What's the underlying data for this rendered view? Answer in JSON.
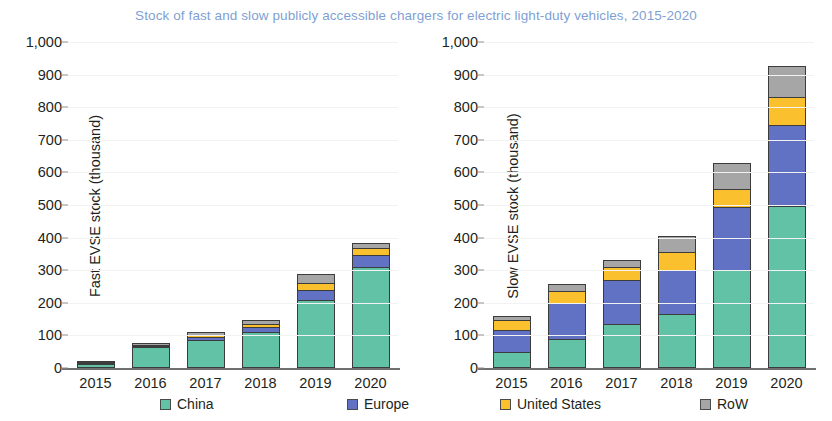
{
  "title": "Stock of fast and slow publicly accessible chargers for electric light-duty vehicles, 2015-2020",
  "title_color": "#7f9fd4",
  "legend": {
    "items": [
      {
        "label": "China",
        "color": "#62c2a5"
      },
      {
        "label": "Europe",
        "color": "#6171c4"
      },
      {
        "label": "United States",
        "color": "#fbc02d"
      },
      {
        "label": "RoW",
        "color": "#a6a6a6"
      }
    ]
  },
  "chart_data": [
    {
      "type": "bar",
      "stacked": true,
      "panel": "left",
      "title": "",
      "xlabel": "",
      "ylabel": "Fast EVSE stock (thousand)",
      "categories": [
        "2015",
        "2016",
        "2017",
        "2018",
        "2019",
        "2020"
      ],
      "ylim": [
        0,
        1000
      ],
      "yticks": [
        "0",
        "100",
        "200",
        "300",
        "400",
        "500",
        "600",
        "700",
        "800",
        "900",
        "1,000"
      ],
      "ytick_values": [
        0,
        100,
        200,
        300,
        400,
        500,
        600,
        700,
        800,
        900,
        1000
      ],
      "grid": false,
      "legend_position": "bottom",
      "series": [
        {
          "name": "China",
          "color": "#62c2a5",
          "values": [
            12,
            63,
            85,
            110,
            210,
            310
          ]
        },
        {
          "name": "Europe",
          "color": "#6171c4",
          "values": [
            4,
            5,
            10,
            16,
            30,
            38
          ]
        },
        {
          "name": "United States",
          "color": "#fbc02d",
          "values": [
            2,
            3,
            5,
            8,
            22,
            20
          ]
        },
        {
          "name": "RoW",
          "color": "#a6a6a6",
          "values": [
            4,
            6,
            10,
            13,
            25,
            15
          ]
        }
      ],
      "totals": [
        22,
        77,
        110,
        147,
        267,
        383
      ]
    },
    {
      "type": "bar",
      "stacked": true,
      "panel": "right",
      "title": "",
      "xlabel": "",
      "ylabel": "Slow EVSE stock (thousand)",
      "categories": [
        "2015",
        "2016",
        "2017",
        "2018",
        "2019",
        "2020"
      ],
      "ylim": [
        0,
        1000
      ],
      "yticks": [
        "0",
        "100",
        "200",
        "300",
        "400",
        "500",
        "600",
        "700",
        "800",
        "900",
        "1,000"
      ],
      "ytick_values": [
        0,
        100,
        200,
        300,
        400,
        500,
        600,
        700,
        800,
        900,
        1000
      ],
      "grid": false,
      "legend_position": "bottom",
      "series": [
        {
          "name": "China",
          "color": "#62c2a5",
          "values": [
            48,
            88,
            135,
            165,
            300,
            498
          ]
        },
        {
          "name": "Europe",
          "color": "#6171c4",
          "values": [
            70,
            110,
            135,
            135,
            195,
            248
          ]
        },
        {
          "name": "United States",
          "color": "#fbc02d",
          "values": [
            28,
            38,
            40,
            55,
            55,
            85
          ]
        },
        {
          "name": "RoW",
          "color": "#a6a6a6",
          "values": [
            14,
            22,
            22,
            50,
            78,
            95
          ]
        }
      ],
      "totals": [
        160,
        258,
        332,
        405,
        628,
        926
      ]
    }
  ]
}
